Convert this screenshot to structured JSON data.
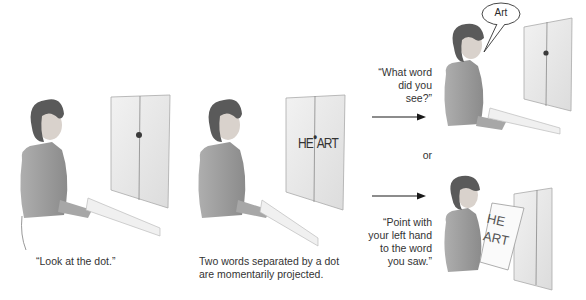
{
  "panels": [
    {
      "id": "panel-1",
      "caption": "“Look at the dot.”",
      "screen": {
        "content": "dot"
      }
    },
    {
      "id": "panel-2",
      "caption_lines": [
        "Two words separated by a dot",
        "are momentarily projected."
      ],
      "screen": {
        "left_word": "HE",
        "right_word": "ART",
        "combined": "HE•ART"
      }
    },
    {
      "id": "panel-3a",
      "prompt_lines": [
        "“What word",
        "did you see?”"
      ],
      "speech_bubble": "Art",
      "screen": {
        "content": "dot"
      }
    },
    {
      "id": "panel-3b",
      "prompt_lines": [
        "“Point with",
        "your left hand",
        "to the word",
        "you saw.”"
      ],
      "card": {
        "line1": "HE",
        "line2": "ART"
      },
      "screen": {
        "content": "blank"
      }
    }
  ],
  "connector": {
    "or_label": "or"
  },
  "colors": {
    "ink": "#2a2a2a",
    "screen": "#e9e9e9",
    "figure": "#8a8a8a",
    "hair": "#5a5a5a"
  }
}
